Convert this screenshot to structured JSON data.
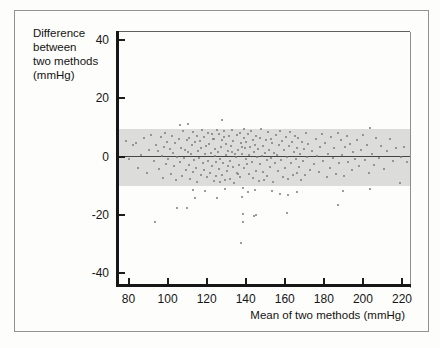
{
  "figure": {
    "y_axis_label_lines": [
      "Difference",
      "between",
      "two methods",
      "(mmHg)"
    ],
    "x_axis_label": "Mean of two methods (mmHg)"
  },
  "colors": {
    "background": "#fdfdfb",
    "frame_border": "#929292",
    "band": "#dcdcda",
    "mean_line": "#454545",
    "point": "#7c7c77",
    "spine": "#161616"
  },
  "chart_data": {
    "type": "scatter",
    "title": "",
    "xlabel": "Mean of two methods (mmHg)",
    "ylabel": "Difference between two methods (mmHg)",
    "xlim": [
      74,
      225
    ],
    "ylim": [
      -44,
      43
    ],
    "x_ticks": [
      80,
      100,
      120,
      140,
      160,
      180,
      200,
      220
    ],
    "y_ticks": [
      40,
      20,
      0,
      -20,
      -40
    ],
    "grid": false,
    "legend": null,
    "mean_line_y": 0,
    "agreement_band": {
      "lower": -10,
      "upper": 9.5
    },
    "points": [
      [
        78.5,
        5.2
      ],
      [
        80.1,
        -0.8
      ],
      [
        82.3,
        3.9
      ],
      [
        84,
        4.7
      ],
      [
        84.8,
        -3.8
      ],
      [
        86.2,
        0.6
      ],
      [
        88.1,
        6.3
      ],
      [
        89.4,
        -5.6
      ],
      [
        90.3,
        2.1
      ],
      [
        91.6,
        7.4
      ],
      [
        92.8,
        -1.5
      ],
      [
        94.1,
        4
      ],
      [
        93.5,
        -22.4
      ],
      [
        95.2,
        1.8
      ],
      [
        95.8,
        -4.2
      ],
      [
        96.4,
        6.8
      ],
      [
        97.1,
        0.3
      ],
      [
        97.7,
        -7.3
      ],
      [
        98.2,
        3.4
      ],
      [
        98.8,
        8.1
      ],
      [
        99.3,
        -2.6
      ],
      [
        99.9,
        5
      ],
      [
        100.4,
        -0.9
      ],
      [
        101,
        2.7
      ],
      [
        101.6,
        -5.9
      ],
      [
        102.1,
        7.2
      ],
      [
        102.7,
        1.1
      ],
      [
        103.3,
        -3.4
      ],
      [
        103.9,
        4.5
      ],
      [
        104.4,
        -8.2
      ],
      [
        104.8,
        -17.7
      ],
      [
        105,
        0
      ],
      [
        105.6,
        6.1
      ],
      [
        106.2,
        -1.9
      ],
      [
        106.4,
        10.9
      ],
      [
        106.8,
        3
      ],
      [
        107.3,
        -6.6
      ],
      [
        107.9,
        8.8
      ],
      [
        108.4,
        -0.4
      ],
      [
        109,
        2.3
      ],
      [
        109.5,
        -4.8
      ],
      [
        109.9,
        -17.7
      ],
      [
        110,
        5.7
      ],
      [
        110.3,
        1.4
      ],
      [
        110.5,
        11.2
      ],
      [
        110.8,
        -2.8
      ],
      [
        111.2,
        6.4
      ],
      [
        111.6,
        -7.8
      ],
      [
        112,
        0.7
      ],
      [
        112.4,
        3.8
      ],
      [
        112.8,
        -5.2
      ],
      [
        113,
        -11.5
      ],
      [
        113.2,
        8.4
      ],
      [
        113.6,
        -1.2
      ],
      [
        114,
        -14.2
      ],
      [
        114.1,
        4.9
      ],
      [
        114.5,
        -3.9
      ],
      [
        114.9,
        7
      ],
      [
        115.3,
        -8.8
      ],
      [
        115.7,
        1.9
      ],
      [
        116.1,
        -0.5
      ],
      [
        116.5,
        5.4
      ],
      [
        116.9,
        -6.2
      ],
      [
        117.3,
        2.9
      ],
      [
        117.7,
        9
      ],
      [
        118.1,
        -2.2
      ],
      [
        118.5,
        6.7
      ],
      [
        118.9,
        -4.6
      ],
      [
        119.2,
        -11.8
      ],
      [
        119.3,
        0.9
      ],
      [
        119.7,
        3.5
      ],
      [
        120.1,
        -7.1
      ],
      [
        120.5,
        8
      ],
      [
        120.9,
        -1.6
      ],
      [
        121.3,
        4.2
      ],
      [
        121.7,
        -5.5
      ],
      [
        122.1,
        1.2
      ],
      [
        122.5,
        7.6
      ],
      [
        122.9,
        -3.1
      ],
      [
        123.3,
        5.9
      ],
      [
        123.7,
        -8.5
      ],
      [
        124.1,
        0.2
      ],
      [
        124.5,
        2.6
      ],
      [
        124.9,
        -6.8
      ],
      [
        125.3,
        -14.2
      ],
      [
        125.3,
        9.2
      ],
      [
        125,
        -2
      ],
      [
        124,
        6
      ],
      [
        125.7,
        1.6
      ],
      [
        126.1,
        -4.4
      ],
      [
        126.5,
        7.8
      ],
      [
        126.9,
        -0.7
      ],
      [
        127.3,
        3.2
      ],
      [
        127.7,
        -6.4
      ],
      [
        128,
        12.6
      ],
      [
        128.1,
        5.6
      ],
      [
        128.5,
        -2.4
      ],
      [
        128.9,
        8.6
      ],
      [
        129.3,
        -8
      ],
      [
        129.4,
        -11.2
      ],
      [
        129.7,
        0.5
      ],
      [
        130.1,
        4.4
      ],
      [
        130.5,
        -5
      ],
      [
        130.9,
        2
      ],
      [
        131.3,
        6.9
      ],
      [
        131.7,
        -1.4
      ],
      [
        132.1,
        -7.6
      ],
      [
        132.5,
        3.6
      ],
      [
        132.9,
        9.1
      ],
      [
        133.3,
        -3.6
      ],
      [
        133.7,
        5.2
      ],
      [
        134.1,
        -9
      ],
      [
        134.5,
        1
      ],
      [
        134.9,
        -0.2
      ],
      [
        135.3,
        7.3
      ],
      [
        135.7,
        -5.8
      ],
      [
        136.1,
        2.4
      ],
      [
        136.5,
        -2.9
      ],
      [
        136.9,
        8.2
      ],
      [
        137.3,
        -7
      ],
      [
        137.5,
        -29.7
      ],
      [
        137.7,
        4.6
      ],
      [
        138.1,
        -13.9
      ],
      [
        138.1,
        0.8
      ],
      [
        138.5,
        -19.7
      ],
      [
        138.6,
        -10.8
      ],
      [
        138.6,
        -22.5
      ],
      [
        138.9,
        6.2
      ],
      [
        139.3,
        -4.1
      ],
      [
        139.7,
        2.8
      ],
      [
        140,
        -1
      ],
      [
        139,
        9.4
      ],
      [
        138,
        3.1
      ],
      [
        136,
        -6.1
      ],
      [
        133,
        1.5
      ],
      [
        131,
        -3.3
      ],
      [
        129,
        6.6
      ],
      [
        127,
        -8.9
      ],
      [
        140.3,
        5.1
      ],
      [
        140.7,
        -2.5
      ],
      [
        141.1,
        -12.2
      ],
      [
        141.1,
        7.7
      ],
      [
        141.5,
        0.4
      ],
      [
        141.9,
        -6
      ],
      [
        142.3,
        3.3
      ],
      [
        142.7,
        8.9
      ],
      [
        143.1,
        -1.8
      ],
      [
        143.5,
        5.8
      ],
      [
        143.9,
        -7.4
      ],
      [
        144.2,
        -20.4
      ],
      [
        144.3,
        1.7
      ],
      [
        144.7,
        -11.5
      ],
      [
        144.7,
        4.1
      ],
      [
        145.1,
        -4.9
      ],
      [
        145.2,
        -20.1
      ],
      [
        145.5,
        7.1
      ],
      [
        145.9,
        -0.3
      ],
      [
        146.3,
        2.5
      ],
      [
        146.7,
        -8.3
      ],
      [
        147.1,
        6.5
      ],
      [
        147.5,
        -2.7
      ],
      [
        147.9,
        9.3
      ],
      [
        148.3,
        0.1
      ],
      [
        148.7,
        -5.4
      ],
      [
        149.1,
        3.7
      ],
      [
        149.5,
        -7.9
      ],
      [
        149.9,
        1.3
      ],
      [
        150.3,
        5.5
      ],
      [
        150.7,
        -1.1
      ],
      [
        151.1,
        -6.7
      ],
      [
        151.5,
        8.3
      ],
      [
        151.9,
        2.2
      ],
      [
        152.3,
        -3.7
      ],
      [
        152.7,
        6
      ],
      [
        153.1,
        -0.6
      ],
      [
        153.4,
        -11.8
      ],
      [
        153.5,
        4.8
      ],
      [
        153.9,
        -8.7
      ],
      [
        154.3,
        1.1
      ],
      [
        155,
        -2.3
      ],
      [
        155.5,
        7.5
      ],
      [
        156,
        0.6
      ],
      [
        156.5,
        -5.1
      ],
      [
        157,
        3.9
      ],
      [
        157.5,
        -12.9
      ],
      [
        157.5,
        8.7
      ],
      [
        158,
        -1.3
      ],
      [
        158.5,
        5.3
      ],
      [
        159,
        -6.9
      ],
      [
        159.5,
        2.1
      ],
      [
        160,
        -4
      ],
      [
        160.5,
        6.8
      ],
      [
        161,
        0
      ],
      [
        161.1,
        -19.4
      ],
      [
        161.5,
        -7.7
      ],
      [
        161.6,
        -13.2
      ],
      [
        162,
        3.5
      ],
      [
        162.5,
        8.5
      ],
      [
        163,
        -2.1
      ],
      [
        163.5,
        4.9
      ],
      [
        164,
        -6.3
      ],
      [
        164.5,
        1.5
      ],
      [
        165,
        7
      ],
      [
        165.5,
        -0.9
      ],
      [
        166,
        -5.7
      ],
      [
        166.2,
        -12.2
      ],
      [
        166.5,
        3
      ],
      [
        167,
        6.3
      ],
      [
        167.5,
        -3.5
      ],
      [
        168,
        0.8
      ],
      [
        168.5,
        -8.1
      ],
      [
        169,
        5
      ],
      [
        169.5,
        -1.7
      ],
      [
        170,
        2.7
      ],
      [
        170.5,
        -6.5
      ],
      [
        171,
        7.9
      ],
      [
        171.5,
        -0.1
      ],
      [
        172,
        4.3
      ],
      [
        173,
        -4.5
      ],
      [
        174,
        1.9
      ],
      [
        175,
        -2.6
      ],
      [
        175.8,
        6.1
      ],
      [
        176.6,
        0.3
      ],
      [
        177.4,
        -5.3
      ],
      [
        178.2,
        3.4
      ],
      [
        179,
        7.6
      ],
      [
        179.8,
        -1.5
      ],
      [
        180.6,
        4.6
      ],
      [
        181.4,
        -7.2
      ],
      [
        182.2,
        1
      ],
      [
        183,
        -3.9
      ],
      [
        183.8,
        6.6
      ],
      [
        184.6,
        -0.6
      ],
      [
        185.4,
        2.9
      ],
      [
        186.2,
        -5.9
      ],
      [
        187,
        8
      ],
      [
        187.2,
        -16.7
      ],
      [
        187.8,
        -2.2
      ],
      [
        188.6,
        5.5
      ],
      [
        189.4,
        0.5
      ],
      [
        189.8,
        -11.8
      ],
      [
        190.2,
        -6.6
      ],
      [
        191,
        3.2
      ],
      [
        191.8,
        7.2
      ],
      [
        192.6,
        -1.9
      ],
      [
        193.4,
        4.4
      ],
      [
        194.2,
        -4.7
      ],
      [
        195,
        1.6
      ],
      [
        196,
        -0.8
      ],
      [
        197,
        5.8
      ],
      [
        198,
        -3.2
      ],
      [
        199,
        2.4
      ],
      [
        200,
        7.4
      ],
      [
        201,
        -1.2
      ],
      [
        202,
        4
      ],
      [
        203,
        -5.6
      ],
      [
        203.6,
        9.8
      ],
      [
        203.6,
        -11.2
      ],
      [
        204.5,
        0.9
      ],
      [
        205.5,
        -2.8
      ],
      [
        206.5,
        6.2
      ],
      [
        208,
        -0.4
      ],
      [
        209.5,
        3.6
      ],
      [
        211,
        -4.3
      ],
      [
        212.5,
        1.8
      ],
      [
        214,
        5.9
      ],
      [
        215.5,
        -1.6
      ],
      [
        217,
        2.8
      ],
      [
        219,
        -9.2
      ],
      [
        219.5,
        -0.2
      ],
      [
        221,
        3.4
      ],
      [
        222.5,
        -2
      ]
    ]
  }
}
